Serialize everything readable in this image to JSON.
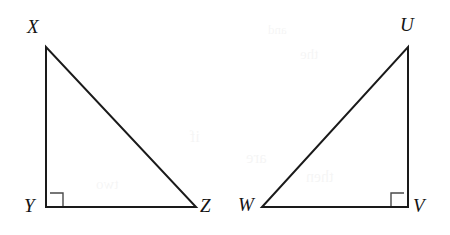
{
  "figure": {
    "canvas": {
      "width": 450,
      "height": 235
    },
    "background_color": "#ffffff",
    "stroke_color": "#1a1a1a",
    "mark_color": "#4a4a4a"
  },
  "triangles": [
    {
      "name": "triangle-xyz",
      "vertices": [
        {
          "label": "X",
          "x": 46,
          "y": 47,
          "label_x": 27,
          "label_y": 17
        },
        {
          "label": "Y",
          "x": 46,
          "y": 207,
          "label_x": 24,
          "label_y": 196
        },
        {
          "label": "Z",
          "x": 196,
          "y": 207,
          "label_x": 200,
          "label_y": 196
        }
      ],
      "path": "M 46 47 L 46 207 L 196 207 Z",
      "right_angle": {
        "at": "Y",
        "mark_path": "M 50 193 L 63 193 L 63 206",
        "symbol": "right-angle"
      }
    },
    {
      "name": "triangle-uvw",
      "vertices": [
        {
          "label": "U",
          "x": 408,
          "y": 47,
          "label_x": 400,
          "label_y": 15
        },
        {
          "label": "V",
          "x": 408,
          "y": 207,
          "label_x": 413,
          "label_y": 196
        },
        {
          "label": "W",
          "x": 262,
          "y": 207,
          "label_x": 238,
          "label_y": 195
        }
      ],
      "path": "M 408 47 L 408 207 L 262 207 Z",
      "right_angle": {
        "at": "V",
        "mark_path": "M 404 193 L 391 193 L 391 206",
        "symbol": "right-angle"
      }
    }
  ],
  "bleed_text": [
    {
      "text": "and",
      "x": 268,
      "y": 22,
      "size": 13
    },
    {
      "text": "the",
      "x": 300,
      "y": 46,
      "size": 15
    },
    {
      "text": "if",
      "x": 190,
      "y": 128,
      "size": 16
    },
    {
      "text": "are",
      "x": 246,
      "y": 148,
      "size": 17
    },
    {
      "text": "then",
      "x": 306,
      "y": 168,
      "size": 16
    },
    {
      "text": "two",
      "x": 96,
      "y": 176,
      "size": 15
    }
  ]
}
